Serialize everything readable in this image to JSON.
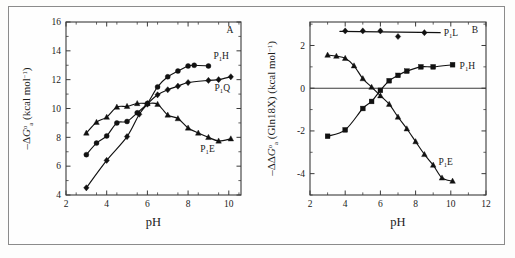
{
  "figure": {
    "panel_a_letter": "A",
    "panel_b_letter": "B"
  },
  "chart_data": [
    {
      "type": "scatter",
      "panel": "A",
      "title": "",
      "xlabel": "pH",
      "ylabel": "-ΔG°a (kcal mol⁻¹)",
      "ylabel_parts": {
        "lead": "–Δ",
        "italic": "G",
        "sup": "o",
        "sub": "a",
        "tail": " (kcal mol",
        "tail_sup": "−1",
        "tail_end": ")"
      },
      "xlim": [
        2,
        10.6
      ],
      "ylim": [
        4,
        16
      ],
      "xticks": [
        2,
        4,
        6,
        8,
        10
      ],
      "yticks": [
        4,
        6,
        8,
        10,
        12,
        14,
        16
      ],
      "xtick_labels": [
        "2",
        "4",
        "6",
        "8",
        "10"
      ],
      "ytick_labels": [
        "4",
        "6",
        "8",
        "10",
        "12",
        "14",
        "16"
      ],
      "grid": false,
      "legend_position": "inline-right",
      "series": [
        {
          "name": "P1H",
          "label": "P₁H",
          "label_parts": {
            "base": "P",
            "sub": "1",
            "tail": "H"
          },
          "marker": "circle",
          "x": [
            3.0,
            3.5,
            4.0,
            4.5,
            5.0,
            5.5,
            6.0,
            6.5,
            7.0,
            7.5,
            8.0,
            8.3,
            9.0
          ],
          "y": [
            6.8,
            7.6,
            8.1,
            9.0,
            9.1,
            9.7,
            10.35,
            11.5,
            12.2,
            12.6,
            12.95,
            13.0,
            12.95
          ]
        },
        {
          "name": "P1Q",
          "label": "P₁Q",
          "label_parts": {
            "base": "P",
            "sub": "1",
            "tail": "Q"
          },
          "marker": "diamond",
          "x": [
            3.0,
            4.0,
            5.0,
            5.6,
            6.0,
            6.5,
            7.0,
            7.5,
            8.0,
            9.0,
            9.5,
            10.1
          ],
          "y": [
            4.5,
            6.4,
            8.05,
            9.6,
            10.3,
            10.95,
            11.3,
            11.55,
            11.8,
            11.95,
            12.0,
            12.2
          ]
        },
        {
          "name": "P1E",
          "label": "P₁E",
          "label_parts": {
            "base": "P",
            "sub": "1",
            "tail": "E"
          },
          "marker": "triangle",
          "x": [
            3.0,
            3.5,
            4.0,
            4.5,
            5.0,
            5.5,
            6.0,
            6.5,
            7.0,
            7.5,
            8.0,
            8.5,
            9.0,
            9.5,
            10.1
          ],
          "y": [
            8.3,
            9.05,
            9.4,
            10.1,
            10.15,
            10.35,
            10.35,
            10.3,
            9.55,
            9.3,
            8.65,
            8.3,
            8.0,
            7.75,
            7.9
          ]
        }
      ]
    },
    {
      "type": "scatter",
      "panel": "B",
      "title": "",
      "xlabel": "pH",
      "ylabel": "-ΔΔG°a (Gln18X) (kcal mol⁻¹)",
      "ylabel_parts": {
        "lead": "–ΔΔ",
        "italic": "G",
        "sup": "o",
        "sub": "a",
        "tail": " (Gln18X) (kcal mol",
        "tail_sup": "−1",
        "tail_end": ")"
      },
      "xlim": [
        2,
        12
      ],
      "ylim": [
        -5.0,
        3.1
      ],
      "xticks": [
        2,
        4,
        6,
        8,
        10,
        12
      ],
      "yticks": [
        2,
        0,
        -2,
        -4
      ],
      "xtick_labels": [
        "2",
        "4",
        "6",
        "8",
        "10",
        "12"
      ],
      "ytick_labels": [
        "2",
        "0",
        "-2",
        "-4"
      ],
      "grid": false,
      "zero_line": 0,
      "legend_position": "inline-right",
      "series": [
        {
          "name": "P1L",
          "label": "P₁L",
          "label_parts": {
            "base": "P",
            "sub": "1",
            "tail": "L"
          },
          "marker": "diamond",
          "x": [
            4.0,
            5.0,
            6.0,
            7.0,
            8.5
          ],
          "y": [
            2.68,
            2.68,
            2.68,
            2.42,
            2.6
          ]
        },
        {
          "name": "P1H",
          "label": "P₁H",
          "label_parts": {
            "base": "P",
            "sub": "1",
            "tail": "H"
          },
          "marker": "square",
          "x": [
            3.0,
            4.0,
            5.0,
            5.5,
            6.0,
            6.5,
            7.0,
            7.5,
            8.3,
            9.0,
            10.1
          ],
          "y": [
            -2.25,
            -1.95,
            -0.95,
            -0.62,
            -0.1,
            0.35,
            0.6,
            0.8,
            1.0,
            1.0,
            1.1
          ]
        },
        {
          "name": "P1E",
          "label": "P₁E",
          "label_parts": {
            "base": "P",
            "sub": "1",
            "tail": "E"
          },
          "marker": "triangle",
          "x": [
            3.0,
            3.5,
            4.0,
            4.5,
            5.0,
            5.5,
            6.0,
            6.5,
            7.0,
            7.5,
            8.0,
            8.5,
            9.0,
            9.5,
            10.1
          ],
          "y": [
            1.55,
            1.5,
            1.4,
            1.05,
            0.45,
            0.05,
            -0.35,
            -0.75,
            -1.35,
            -1.9,
            -2.5,
            -3.1,
            -3.6,
            -4.2,
            -4.35
          ]
        }
      ]
    }
  ],
  "axis_labels": {
    "ph": "pH"
  },
  "series_label_positions": {
    "a_p1h": {
      "x": 9.25,
      "y": 13.45
    },
    "a_p1q": {
      "x": 9.3,
      "y": 11.2
    },
    "a_p1e": {
      "x": 8.6,
      "y": 7.0
    },
    "b_p1l": {
      "x": 9.6,
      "y": 2.6
    },
    "b_p1h": {
      "x": 10.5,
      "y": 1.05
    },
    "b_p1e": {
      "x": 9.3,
      "y": -3.45
    }
  }
}
